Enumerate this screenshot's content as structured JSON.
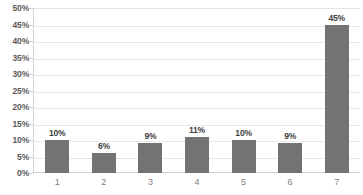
{
  "chart_data": {
    "type": "bar",
    "title": "",
    "subtitle": "",
    "xlabel": "",
    "ylabel": "",
    "categories": [
      "1",
      "2",
      "3",
      "4",
      "5",
      "6",
      "7"
    ],
    "values": [
      10,
      6,
      9,
      11,
      10,
      9,
      45
    ],
    "data_labels": [
      "10%",
      "6%",
      "9%",
      "11%",
      "10%",
      "9%",
      "45%"
    ],
    "ylim": [
      0,
      50
    ],
    "ytick_step": 5,
    "ytick_labels": [
      "50%",
      "45%",
      "40%",
      "35%",
      "30%",
      "25%",
      "20%",
      "15%",
      "10%",
      "5%",
      "0%"
    ],
    "ytick_values": [
      50,
      45,
      40,
      35,
      30,
      25,
      20,
      15,
      10,
      5,
      0
    ],
    "grid": true,
    "grid_axis": "y",
    "legend": false,
    "legend_position": "none",
    "series": [
      {
        "name": "",
        "values": [
          10,
          6,
          9,
          11,
          10,
          9,
          45
        ]
      }
    ],
    "colors": {
      "bar_fill": "#737373",
      "gridline": "#e8e8e8",
      "axis_line": "#d0d0d0",
      "tick_label": "#5a5a5a",
      "category_label": "#808080",
      "data_label": "#404040",
      "background": "#ffffff"
    }
  }
}
